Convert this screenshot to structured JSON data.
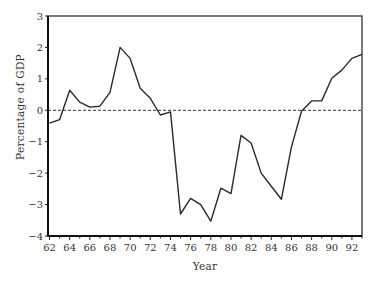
{
  "chart_data": {
    "type": "line",
    "title": "",
    "xlabel": "Year",
    "ylabel": "Percentage of GDP",
    "xlim": [
      62,
      93
    ],
    "ylim": [
      -4,
      3
    ],
    "grid": false,
    "legend": null,
    "reference_line": {
      "y": 0,
      "style": "dashed"
    },
    "x_ticks": [
      62,
      64,
      66,
      68,
      70,
      72,
      74,
      76,
      78,
      80,
      82,
      84,
      86,
      88,
      90,
      92
    ],
    "x_tick_labels": [
      "62",
      "64",
      "66",
      "68",
      "70",
      "72",
      "74",
      "76",
      "78",
      "80",
      "82",
      "84",
      "86",
      "88",
      "90",
      "92"
    ],
    "y_ticks": [
      3,
      2,
      1,
      0,
      -1,
      -2,
      -3,
      -4
    ],
    "y_tick_labels": [
      "3",
      "2",
      "1",
      "0",
      "-1",
      "-2",
      "-3",
      "-4"
    ],
    "x": [
      62,
      63,
      64,
      65,
      66,
      67,
      68,
      69,
      70,
      71,
      72,
      73,
      74,
      75,
      76,
      77,
      78,
      79,
      80,
      81,
      82,
      83,
      84,
      85,
      86,
      87,
      88,
      89,
      90,
      91,
      92,
      93
    ],
    "series": [
      {
        "name": "Percentage of GDP",
        "values": [
          -0.41,
          -0.3,
          0.64,
          0.26,
          0.1,
          0.13,
          0.57,
          2.0,
          1.65,
          0.7,
          0.38,
          -0.15,
          -0.05,
          -3.3,
          -2.8,
          -3.0,
          -3.53,
          -2.48,
          -2.65,
          -0.8,
          -1.04,
          -2.0,
          -2.42,
          -2.83,
          -1.17,
          -0.03,
          0.3,
          0.3,
          1.02,
          1.28,
          1.65,
          1.78
        ]
      }
    ]
  },
  "colors": {
    "line": "#2a2a2a",
    "axis": "#222222",
    "text": "#333333",
    "background": "#ffffff"
  }
}
